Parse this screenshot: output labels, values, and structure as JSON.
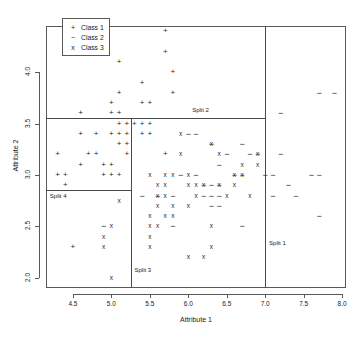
{
  "chart_data": {
    "type": "scatter",
    "title": "",
    "xlabel": "Attribute 1",
    "ylabel": "Attribute 2",
    "xlim": [
      4.15,
      8.05
    ],
    "ylim": [
      1.9,
      4.45
    ],
    "xticks": [
      "4.5",
      "5.0",
      "5.5",
      "6.0",
      "6.5",
      "7.0",
      "7.5",
      "8.0"
    ],
    "xtickvals": [
      4.5,
      5.0,
      5.5,
      6.0,
      6.5,
      7.0,
      7.5,
      8.0
    ],
    "yticks": [
      "2.0",
      "2.5",
      "3.0",
      "3.5",
      "4.0"
    ],
    "ytickvals": [
      2.0,
      2.5,
      3.0,
      3.5,
      4.0
    ],
    "grid": false,
    "legend_position": "top-left",
    "legend": [
      {
        "symbol": "+",
        "label": "Class 1"
      },
      {
        "symbol": "−",
        "label": "Class 2"
      },
      {
        "symbol": "x",
        "label": "Class 3"
      }
    ],
    "annotations": [
      {
        "text": "Split 1",
        "x": 7.05,
        "y": 2.33
      },
      {
        "text": "Split 2",
        "x": 6.05,
        "y": 3.62
      },
      {
        "text": "Split 3",
        "x": 5.3,
        "y": 2.07
      },
      {
        "text": "Split 4",
        "x": 4.2,
        "y": 2.79
      }
    ],
    "split_lines": [
      {
        "name": "Split 1",
        "orientation": "vertical",
        "value": 7.0,
        "from": 1.9,
        "to": 4.45
      },
      {
        "name": "Split 2",
        "orientation": "horizontal",
        "value": 3.55,
        "from": 4.15,
        "to": 7.0
      },
      {
        "name": "Split 3",
        "orientation": "vertical",
        "value": 5.25,
        "from": 1.9,
        "to": 3.55
      },
      {
        "name": "Split 4",
        "orientation": "horizontal",
        "value": 2.85,
        "from": 4.15,
        "to": 5.25
      }
    ],
    "series": [
      {
        "name": "Class 1",
        "symbol": "+",
        "points": [
          [
            5.7,
            4.4
          ],
          [
            5.1,
            4.1
          ],
          [
            5.7,
            4.2
          ],
          [
            5.8,
            4.0
          ],
          [
            5.4,
            3.9
          ],
          [
            5.1,
            3.8
          ],
          [
            5.8,
            3.8
          ],
          [
            5.0,
            3.7
          ],
          [
            5.4,
            3.7
          ],
          [
            5.5,
            3.7
          ],
          [
            4.6,
            3.6
          ],
          [
            5.0,
            3.6
          ],
          [
            5.1,
            3.6
          ],
          [
            5.1,
            3.5
          ],
          [
            5.2,
            3.5
          ],
          [
            5.3,
            3.5
          ],
          [
            5.4,
            3.5
          ],
          [
            5.5,
            3.5
          ],
          [
            4.6,
            3.4
          ],
          [
            4.8,
            3.4
          ],
          [
            5.0,
            3.4
          ],
          [
            5.1,
            3.4
          ],
          [
            5.2,
            3.4
          ],
          [
            5.4,
            3.4
          ],
          [
            5.5,
            3.4
          ],
          [
            5.1,
            3.3
          ],
          [
            5.2,
            3.3
          ],
          [
            4.3,
            3.2
          ],
          [
            4.7,
            3.2
          ],
          [
            4.8,
            3.2
          ],
          [
            5.2,
            3.2
          ],
          [
            5.7,
            3.2
          ],
          [
            4.6,
            3.1
          ],
          [
            4.9,
            3.1
          ],
          [
            5.0,
            3.1
          ],
          [
            4.3,
            3.0
          ],
          [
            4.4,
            3.0
          ],
          [
            4.9,
            3.0
          ],
          [
            5.0,
            3.0
          ],
          [
            5.1,
            3.0
          ],
          [
            4.4,
            2.9
          ],
          [
            4.5,
            2.3
          ]
        ]
      },
      {
        "name": "Class 2",
        "symbol": "−",
        "points": [
          [
            7.2,
            3.6
          ],
          [
            7.7,
            3.8
          ],
          [
            7.9,
            3.8
          ],
          [
            6.0,
            3.4
          ],
          [
            6.1,
            3.4
          ],
          [
            6.7,
            3.3
          ],
          [
            6.3,
            3.3
          ],
          [
            6.5,
            3.2
          ],
          [
            7.2,
            3.2
          ],
          [
            6.8,
            3.2
          ],
          [
            6.9,
            3.2
          ],
          [
            6.4,
            3.1
          ],
          [
            7.0,
            3.0
          ],
          [
            7.1,
            3.0
          ],
          [
            7.6,
            3.0
          ],
          [
            7.7,
            3.0
          ],
          [
            6.6,
            3.0
          ],
          [
            6.7,
            3.0
          ],
          [
            6.1,
            3.0
          ],
          [
            5.9,
            3.0
          ],
          [
            6.3,
            2.9
          ],
          [
            7.3,
            2.9
          ],
          [
            6.2,
            2.9
          ],
          [
            6.4,
            2.9
          ],
          [
            5.6,
            2.8
          ],
          [
            5.8,
            2.8
          ],
          [
            6.2,
            2.8
          ],
          [
            6.3,
            2.8
          ],
          [
            6.4,
            2.8
          ],
          [
            7.1,
            2.8
          ],
          [
            7.4,
            2.8
          ],
          [
            5.4,
            2.8
          ],
          [
            6.3,
            2.7
          ],
          [
            6.4,
            2.7
          ],
          [
            6.7,
            2.5
          ],
          [
            7.7,
            2.6
          ],
          [
            5.8,
            2.5
          ],
          [
            4.9,
            2.5
          ]
        ]
      },
      {
        "name": "Class 3",
        "symbol": "x",
        "points": [
          [
            5.9,
            3.4
          ],
          [
            6.3,
            3.3
          ],
          [
            5.9,
            3.2
          ],
          [
            6.4,
            3.2
          ],
          [
            6.9,
            3.2
          ],
          [
            6.7,
            3.1
          ],
          [
            6.9,
            3.1
          ],
          [
            5.5,
            3.0
          ],
          [
            5.7,
            3.0
          ],
          [
            5.8,
            3.0
          ],
          [
            6.0,
            3.0
          ],
          [
            6.6,
            3.0
          ],
          [
            6.7,
            3.0
          ],
          [
            5.6,
            2.9
          ],
          [
            5.7,
            2.9
          ],
          [
            6.0,
            2.9
          ],
          [
            6.1,
            2.9
          ],
          [
            6.2,
            2.9
          ],
          [
            6.4,
            2.9
          ],
          [
            6.6,
            2.9
          ],
          [
            5.6,
            2.8
          ],
          [
            5.7,
            2.8
          ],
          [
            6.1,
            2.8
          ],
          [
            6.5,
            2.8
          ],
          [
            6.8,
            2.8
          ],
          [
            5.1,
            2.75
          ],
          [
            5.6,
            2.7
          ],
          [
            5.8,
            2.7
          ],
          [
            6.0,
            2.7
          ],
          [
            5.5,
            2.6
          ],
          [
            5.7,
            2.6
          ],
          [
            5.8,
            2.6
          ],
          [
            5.0,
            2.5
          ],
          [
            5.5,
            2.5
          ],
          [
            5.6,
            2.5
          ],
          [
            6.3,
            2.5
          ],
          [
            5.5,
            2.4
          ],
          [
            4.9,
            2.4
          ],
          [
            5.5,
            2.3
          ],
          [
            4.9,
            2.3
          ],
          [
            6.3,
            2.3
          ],
          [
            6.0,
            2.2
          ],
          [
            6.2,
            2.2
          ],
          [
            5.0,
            2.0
          ]
        ]
      }
    ]
  }
}
